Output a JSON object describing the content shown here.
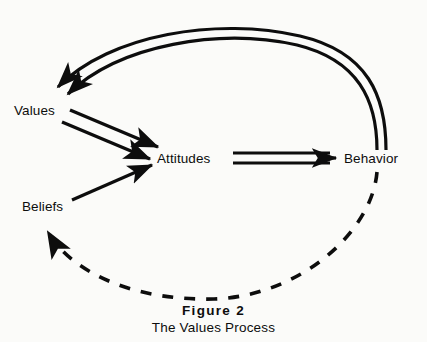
{
  "figure": {
    "caption_title": "Figure  2",
    "caption_subtitle": "The Values Process",
    "background_color": "#fbfbf9",
    "ink_color": "#0d0d0d"
  },
  "diagram": {
    "type": "flow-diagram",
    "nodes": [
      {
        "id": "values",
        "label": "Values",
        "x": 14,
        "y": 103
      },
      {
        "id": "attitudes",
        "label": "Attitudes",
        "x": 157,
        "y": 151
      },
      {
        "id": "behavior",
        "label": "Behavior",
        "x": 344,
        "y": 151
      },
      {
        "id": "beliefs",
        "label": "Beliefs",
        "x": 22,
        "y": 199
      }
    ],
    "edges": [
      {
        "id": "values-to-attitudes",
        "from": "values",
        "to": "attitudes",
        "style": "double-line",
        "arrowheads": 2,
        "dashed": false
      },
      {
        "id": "beliefs-to-attitudes",
        "from": "beliefs",
        "to": "attitudes",
        "style": "single-line",
        "arrowheads": 1,
        "dashed": false
      },
      {
        "id": "attitudes-to-behavior",
        "from": "attitudes",
        "to": "behavior",
        "style": "double-line",
        "arrowheads": 1,
        "dashed": false
      },
      {
        "id": "behavior-to-values",
        "from": "behavior",
        "to": "values",
        "style": "double-line-curve",
        "arrowheads": 2,
        "dashed": false
      },
      {
        "id": "behavior-to-beliefs",
        "from": "behavior",
        "to": "beliefs",
        "style": "curve",
        "arrowheads": 1,
        "dashed": true
      }
    ]
  }
}
